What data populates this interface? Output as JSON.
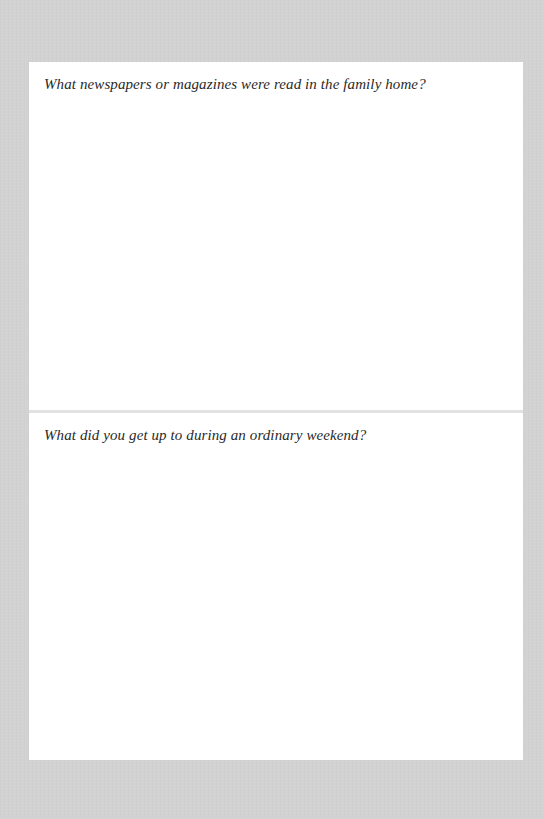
{
  "page": {
    "background_color": "#d2d2d2",
    "sheet_color": "#ffffff",
    "divider_color": "#e2e2e2"
  },
  "questions": [
    {
      "text": "What newspapers or magazines were read in the family home?",
      "answer": ""
    },
    {
      "text": "What did you get up to during an ordinary weekend?",
      "answer": ""
    }
  ]
}
